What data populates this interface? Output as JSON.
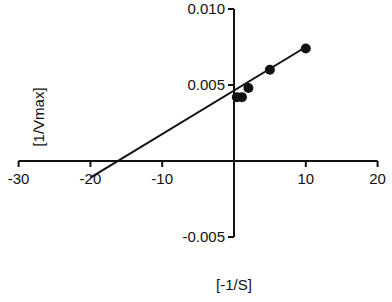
{
  "chart_data": {
    "type": "scatter",
    "title": "",
    "xlabel": "[-1/S]",
    "ylabel": "[1/Vmax]",
    "xlim": [
      -30,
      20
    ],
    "ylim": [
      -0.005,
      0.01
    ],
    "x_ticks": [
      -30,
      -20,
      -10,
      10,
      20
    ],
    "x_tick_labels": [
      "-30",
      "-20",
      "-10",
      "10",
      "20"
    ],
    "y_ticks": [
      0.01,
      0.005,
      -0.005
    ],
    "y_tick_labels": [
      "0.010",
      "0.005",
      "-0.005"
    ],
    "grid": false,
    "legend": null,
    "series": [
      {
        "name": "data",
        "x": [
          0.4,
          1.1,
          2.0,
          5.0,
          10.0
        ],
        "y": [
          0.0042,
          0.0042,
          0.0048,
          0.006,
          0.0074
        ],
        "marker": "filled-circle",
        "color": "#111111"
      }
    ],
    "fit_line": {
      "x": [
        -20,
        10
      ],
      "y": [
        -0.0011,
        0.0075
      ],
      "x_intercept": -13,
      "color": "#111111"
    }
  }
}
